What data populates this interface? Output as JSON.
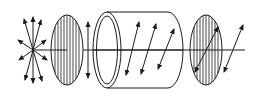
{
  "diagram": {
    "type": "optical-rotation-polarimeter",
    "colors": {
      "ink": "#1a1a1a",
      "background": "#ffffff"
    },
    "components": [
      {
        "id": "light-source",
        "description": "unpolarized light (radiating arrows)"
      },
      {
        "id": "polarizer",
        "description": "polarizer with vertical transmission axis"
      },
      {
        "id": "polarized-light",
        "description": "vertically polarized light"
      },
      {
        "id": "sample-tube",
        "description": "sample tube with rotating polarization plane"
      },
      {
        "id": "analyzer",
        "description": "analyzer rotated to match plane"
      },
      {
        "id": "transmitted-light",
        "description": "rotated polarized light"
      }
    ]
  }
}
